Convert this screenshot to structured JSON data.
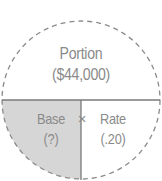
{
  "diagram": {
    "type": "percentage-formula-circle",
    "top": {
      "label": "Portion",
      "value": "($44,000)"
    },
    "bottom_left": {
      "label": "Base",
      "value": "(?)",
      "highlighted": true
    },
    "bottom_right": {
      "label": "Rate",
      "value": "(.20)"
    },
    "operator": "×",
    "colors": {
      "outline": "#8a8a8a",
      "divider": "#7a7a7a",
      "text": "#8a8a8a",
      "highlight_fill": "#d6d6d6",
      "background": "#ffffff"
    }
  }
}
